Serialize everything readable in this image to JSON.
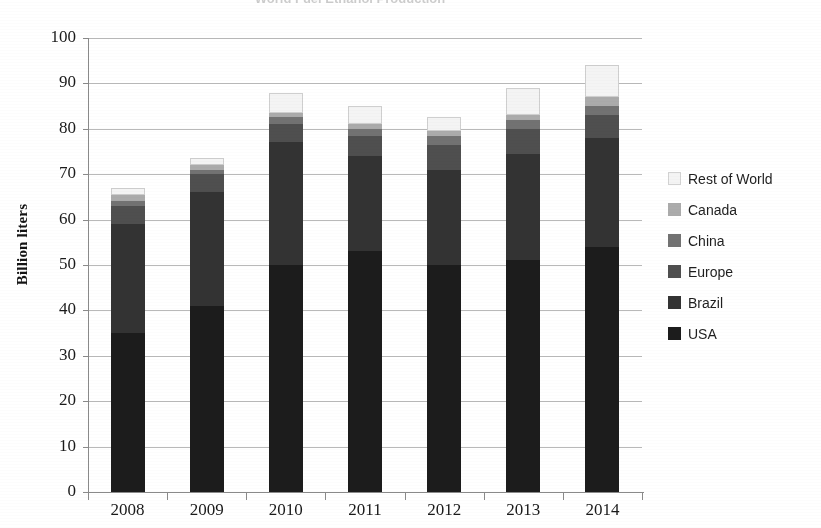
{
  "chart_data": {
    "type": "bar",
    "subtype": "stacked-bar",
    "title": "World Fuel Ethanol Production",
    "xlabel": "",
    "ylabel": "Billion liters",
    "ylim": [
      0,
      100
    ],
    "ytick_step": 10,
    "grid": true,
    "legend_position": "right",
    "categories": [
      "2008",
      "2009",
      "2010",
      "2011",
      "2012",
      "2013",
      "2014"
    ],
    "ytick_labels": [
      "100",
      "90",
      "80",
      "70",
      "60",
      "50",
      "40",
      "30",
      "20",
      "10",
      "0"
    ],
    "series": [
      {
        "name": "USA",
        "color": "#1c1c1c",
        "values": [
          35,
          41,
          50,
          53,
          50,
          51,
          54
        ]
      },
      {
        "name": "Brazil",
        "color": "#333333",
        "values": [
          24,
          25,
          27,
          21,
          21,
          23.5,
          24
        ]
      },
      {
        "name": "Europe",
        "color": "#4f4f4f",
        "values": [
          4,
          4,
          4,
          4.5,
          5.5,
          5.5,
          5
        ]
      },
      {
        "name": "China",
        "color": "#727272",
        "values": [
          1,
          1,
          1.5,
          1.5,
          2,
          2,
          2
        ]
      },
      {
        "name": "Canada",
        "color": "#ababab",
        "values": [
          1.5,
          1,
          1,
          1,
          1,
          1,
          2
        ]
      },
      {
        "name": "Rest of World",
        "color": "#f4f4f4",
        "values": [
          1.5,
          1.5,
          4.5,
          4,
          3,
          6,
          7
        ]
      }
    ],
    "totals": [
      67,
      73.5,
      88,
      85,
      82.5,
      89,
      94
    ]
  },
  "legend": {
    "entries": [
      {
        "label": "Rest of World",
        "color": "#f4f4f4"
      },
      {
        "label": "Canada",
        "color": "#ababab"
      },
      {
        "label": "China",
        "color": "#727272"
      },
      {
        "label": "Europe",
        "color": "#4f4f4f"
      },
      {
        "label": "Brazil",
        "color": "#333333"
      },
      {
        "label": "USA",
        "color": "#1c1c1c"
      }
    ]
  }
}
